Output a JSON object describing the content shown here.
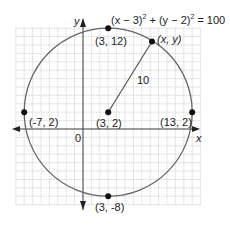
{
  "diagram": {
    "equation": {
      "part1": "(x − 3)",
      "exp1": "2",
      "plus": " + (y − 2)",
      "exp2": "2",
      "rhs": " = 100"
    },
    "axes": {
      "x_label": "x",
      "y_label": "y",
      "origin_label": "0"
    },
    "circle": {
      "center": [
        3,
        2
      ],
      "radius": 10,
      "color": "#666666"
    },
    "grid": {
      "x_min": -8,
      "x_max": 14,
      "y_min": -9,
      "y_max": 12,
      "step": 1,
      "color": "#bbbbbb"
    },
    "points": [
      {
        "id": "center",
        "label": "(3, 2)",
        "x": 3,
        "y": 2
      },
      {
        "id": "top",
        "label": "(3, 12)",
        "x": 3,
        "y": 12
      },
      {
        "id": "bottom",
        "label": "(3, -8)",
        "x": 3,
        "y": -8
      },
      {
        "id": "left",
        "label": "(-7, 2)",
        "x": -7,
        "y": 2
      },
      {
        "id": "right",
        "label": "(13, 2)",
        "x": 13,
        "y": 2
      },
      {
        "id": "general",
        "label": "(x, y)",
        "x": 8.2,
        "y": 10.4
      }
    ],
    "radius_label": "10"
  }
}
